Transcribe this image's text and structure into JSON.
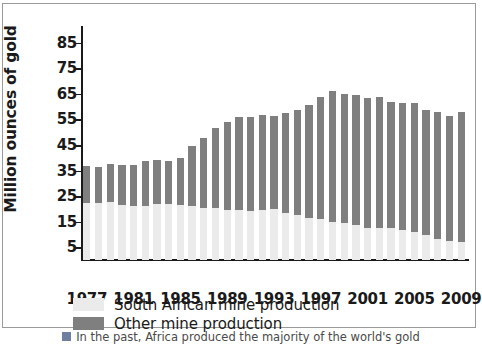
{
  "chart_data": {
    "type": "bar",
    "title": "",
    "subtitle": "",
    "xlabel": "",
    "ylabel": "Million ounces of gold",
    "stacked": true,
    "grid": false,
    "legend_position": "bottom-left",
    "ylim": [
      0,
      90
    ],
    "yticks": [
      5,
      15,
      25,
      35,
      45,
      55,
      65,
      75,
      85
    ],
    "xticks": [
      1977,
      1981,
      1985,
      1989,
      1993,
      1997,
      2001,
      2005,
      2009
    ],
    "categories": [
      "1977",
      "1978",
      "1979",
      "1980",
      "1981",
      "1982",
      "1983",
      "1984",
      "1985",
      "1986",
      "1987",
      "1988",
      "1989",
      "1990",
      "1991",
      "1992",
      "1993",
      "1994",
      "1995",
      "1996",
      "1997",
      "1998",
      "1999",
      "2000",
      "2001",
      "2002",
      "2003",
      "2004",
      "2005",
      "2006",
      "2007",
      "2008",
      "2009"
    ],
    "series": [
      {
        "name": "South African mine production",
        "color": "#ebebeb",
        "values": [
          22.5,
          22.4,
          22.6,
          21.7,
          21.1,
          21.2,
          21.8,
          21.8,
          21.6,
          21.0,
          20.5,
          20.2,
          19.5,
          19.5,
          19.3,
          19.5,
          19.8,
          18.4,
          17.7,
          16.4,
          16.0,
          15.0,
          14.6,
          13.8,
          12.6,
          12.6,
          12.7,
          11.6,
          10.8,
          9.6,
          8.4,
          7.3,
          7.0
        ]
      },
      {
        "name": "Other mine production",
        "color": "#7f7f7f",
        "values": [
          14.3,
          14.1,
          14.9,
          15.6,
          16.0,
          17.5,
          17.3,
          16.8,
          18.3,
          23.6,
          27.4,
          31.5,
          34.4,
          36.4,
          36.5,
          37.4,
          36.5,
          39.0,
          41.2,
          44.2,
          47.9,
          51.0,
          50.5,
          50.9,
          50.8,
          51.3,
          49.2,
          49.9,
          50.7,
          49.1,
          49.5,
          49.2,
          51.1
        ]
      }
    ],
    "totals": [
      36.8,
      36.5,
      37.5,
      37.3,
      37.1,
      38.7,
      39.1,
      38.6,
      39.9,
      44.6,
      47.9,
      51.7,
      53.9,
      55.9,
      55.8,
      56.9,
      56.3,
      57.4,
      58.9,
      60.6,
      63.9,
      66.0,
      65.1,
      64.7,
      63.4,
      63.9,
      61.9,
      61.5,
      61.5,
      58.7,
      57.9,
      56.5,
      58.1
    ]
  },
  "legend": {
    "items": [
      {
        "label": "South African mine production",
        "color": "#ebebeb"
      },
      {
        "label": "Other mine production",
        "color": "#7f7f7f"
      }
    ]
  },
  "caption": {
    "text": "In the past, Africa produced the majority of the world's gold"
  }
}
